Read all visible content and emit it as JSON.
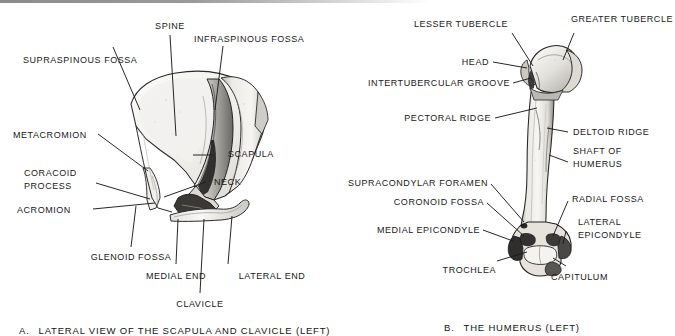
{
  "figure": {
    "kind": "anatomy-plate",
    "background": "#ffffff",
    "ink": "#191919"
  },
  "panel_a": {
    "caption_letter": "A.",
    "caption_text": "LATERAL VIEW OF THE SCAPULA AND CLAVICLE (LEFT)",
    "labels": [
      {
        "id": "spine",
        "text": "SPINE"
      },
      {
        "id": "infraspinous-fossa",
        "text": "INFRASPINOUS FOSSA"
      },
      {
        "id": "supraspinous-fossa",
        "text": "SUPRASPINOUS FOSSA"
      },
      {
        "id": "metacromion",
        "text": "METACROMION"
      },
      {
        "id": "scapula",
        "text": "SCAPULA"
      },
      {
        "id": "coracoid-process-line1",
        "text": "CORACOID"
      },
      {
        "id": "coracoid-process-line2",
        "text": "PROCESS"
      },
      {
        "id": "neck",
        "text": "NECK"
      },
      {
        "id": "acromion",
        "text": "ACROMION"
      },
      {
        "id": "glenoid-fossa",
        "text": "GLENOID FOSSA"
      },
      {
        "id": "medial-end",
        "text": "MEDIAL END"
      },
      {
        "id": "lateral-end",
        "text": "LATERAL END"
      },
      {
        "id": "clavicle",
        "text": "CLAVICLE"
      }
    ]
  },
  "panel_b": {
    "caption_letter": "B.",
    "caption_text": "THE HUMERUS (LEFT)",
    "labels": [
      {
        "id": "lesser-tubercle",
        "text": "LESSER TUBERCLE"
      },
      {
        "id": "greater-tubercle",
        "text": "GREATER TUBERCLE"
      },
      {
        "id": "head",
        "text": "HEAD"
      },
      {
        "id": "intertubercular-groove",
        "text": "INTERTUBERCULAR GROOVE"
      },
      {
        "id": "pectoral-ridge",
        "text": "PECTORAL RIDGE"
      },
      {
        "id": "deltoid-ridge",
        "text": "DELTOID RIDGE"
      },
      {
        "id": "shaft-of-humerus-line1",
        "text": "SHAFT OF"
      },
      {
        "id": "shaft-of-humerus-line2",
        "text": "HUMERUS"
      },
      {
        "id": "supracondylar-foramen",
        "text": "SUPRACONDYLAR FORAMEN"
      },
      {
        "id": "coronoid-fossa",
        "text": "CORONOID FOSSA"
      },
      {
        "id": "radial-fossa",
        "text": "RADIAL FOSSA"
      },
      {
        "id": "medial-epicondyle",
        "text": "MEDIAL EPICONDYLE"
      },
      {
        "id": "lateral-epicondyle-line1",
        "text": "LATERAL"
      },
      {
        "id": "lateral-epicondyle-line2",
        "text": "EPICONDYLE"
      },
      {
        "id": "trochlea",
        "text": "TROCHLEA"
      },
      {
        "id": "capitulum",
        "text": "CAPITULUM"
      }
    ]
  }
}
